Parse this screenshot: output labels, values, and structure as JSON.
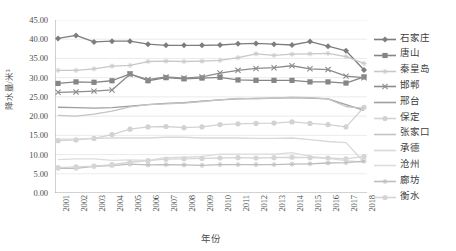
{
  "chart_data": {
    "type": "line",
    "title": "",
    "xlabel": "年份",
    "ylabel": "降水量/米³",
    "ylim": [
      0,
      45
    ],
    "ytick_step": 5,
    "ytick_labels": [
      "0.00",
      "5.00",
      "10.00",
      "15.00",
      "20.00",
      "25.00",
      "30.00",
      "35.00",
      "40.00",
      "45.00"
    ],
    "grid": true,
    "legend_position": "right",
    "categories": [
      "2001",
      "2002",
      "2003",
      "2004",
      "2005",
      "2006",
      "2007",
      "2008",
      "2009",
      "2010",
      "2011",
      "2012",
      "2013",
      "2014",
      "2015",
      "2016",
      "2017",
      "2018"
    ],
    "series": [
      {
        "name": "石家庄",
        "color": "#7d7d7d",
        "marker": "diamond",
        "values": [
          40.2,
          41.0,
          39.3,
          39.5,
          39.5,
          38.7,
          38.4,
          38.4,
          38.4,
          38.5,
          38.8,
          38.9,
          38.7,
          38.5,
          39.4,
          38.2,
          37.0,
          32.0
        ]
      },
      {
        "name": "唐山",
        "color": "#858585",
        "marker": "square",
        "values": [
          28.5,
          28.9,
          28.8,
          29.2,
          31.0,
          29.2,
          30.0,
          29.7,
          29.9,
          30.1,
          29.4,
          29.3,
          29.3,
          29.3,
          28.9,
          28.9,
          28.6,
          30.2
        ]
      },
      {
        "name": "秦皇岛",
        "color": "#c8c8c8",
        "marker": "star",
        "values": [
          31.9,
          31.9,
          32.3,
          33.0,
          33.2,
          34.2,
          34.3,
          34.2,
          34.3,
          34.5,
          35.2,
          36.2,
          35.8,
          36.1,
          36.2,
          36.3,
          35.5,
          33.7
        ]
      },
      {
        "name": "邯郸",
        "color": "#8c8c8c",
        "marker": "x",
        "values": [
          26.2,
          26.3,
          26.5,
          26.8,
          30.9,
          29.5,
          30.2,
          29.9,
          30.2,
          31.2,
          31.9,
          32.4,
          32.6,
          33.1,
          32.3,
          32.1,
          30.4,
          30.0
        ]
      },
      {
        "name": "邢台",
        "color": "#9e9e9e",
        "marker": "none",
        "values": [
          22.3,
          22.2,
          22.1,
          22.2,
          22.6,
          23.0,
          23.3,
          23.5,
          23.9,
          24.2,
          24.5,
          24.6,
          24.7,
          24.8,
          24.7,
          24.5,
          23.0,
          21.5
        ]
      },
      {
        "name": "保定",
        "color": "#d2d2d2",
        "marker": "circle",
        "values": [
          13.6,
          13.8,
          14.2,
          15.2,
          16.6,
          17.2,
          17.3,
          17.0,
          17.2,
          17.8,
          18.0,
          18.1,
          18.2,
          18.5,
          18.1,
          17.8,
          17.2,
          22.3
        ]
      },
      {
        "name": "张家口",
        "color": "#c4c4c4",
        "marker": "none",
        "values": [
          20.2,
          20.0,
          20.5,
          21.3,
          22.4,
          23.0,
          23.2,
          23.4,
          23.8,
          24.2,
          24.6,
          24.5,
          24.7,
          24.9,
          24.8,
          24.5,
          22.5,
          22.0
        ]
      },
      {
        "name": "承德",
        "color": "#d8d8d8",
        "marker": "none",
        "values": [
          14.0,
          14.0,
          14.2,
          14.3,
          14.3,
          14.3,
          14.5,
          14.5,
          14.3,
          14.3,
          14.3,
          14.2,
          14.2,
          14.3,
          13.9,
          13.4,
          13.1,
          8.0
        ]
      },
      {
        "name": "沧州",
        "color": "#dcdcdc",
        "marker": "none",
        "values": [
          8.7,
          8.9,
          8.9,
          8.5,
          8.6,
          8.5,
          9.2,
          9.3,
          9.5,
          10.1,
          10.1,
          10.1,
          10.1,
          10.5,
          9.5,
          9.0,
          8.4,
          8.0
        ]
      },
      {
        "name": "廊坊",
        "color": "#bdbdbd",
        "marker": "star",
        "values": [
          6.4,
          6.4,
          6.9,
          7.1,
          7.5,
          7.3,
          7.4,
          7.3,
          7.2,
          7.4,
          7.4,
          7.4,
          7.4,
          7.5,
          7.6,
          7.8,
          7.9,
          8.3
        ]
      },
      {
        "name": "衡水",
        "color": "#d5d5d5",
        "marker": "circle",
        "values": [
          6.6,
          6.8,
          7.0,
          7.4,
          8.0,
          8.4,
          8.8,
          8.9,
          9.0,
          9.1,
          9.2,
          9.1,
          9.2,
          9.3,
          9.2,
          9.1,
          8.9,
          9.5
        ]
      }
    ]
  },
  "axes": {
    "y_title": "降水量/米³",
    "x_title": "年份"
  }
}
